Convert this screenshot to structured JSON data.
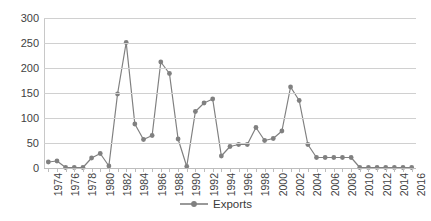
{
  "chart_data": {
    "type": "line",
    "title": "",
    "subtitle": "",
    "xlabel": "",
    "ylabel": "",
    "grid": true,
    "legend_position": "bottom",
    "ylim": [
      0,
      300
    ],
    "y_ticks": [
      0,
      50,
      100,
      150,
      200,
      250,
      300
    ],
    "x_tick_labels": [
      "1974",
      "1976",
      "1978",
      "1980",
      "1982",
      "1984",
      "1986",
      "1988",
      "1990",
      "1992",
      "1994",
      "1996",
      "1998",
      "2000",
      "2002",
      "2004",
      "2006",
      "2008",
      "2010",
      "2012",
      "2014",
      "2016"
    ],
    "x_tick_step": 2,
    "categories": [
      "1974",
      "1975",
      "1976",
      "1977",
      "1978",
      "1979",
      "1980",
      "1981",
      "1982",
      "1983",
      "1984",
      "1985",
      "1986",
      "1987",
      "1988",
      "1989",
      "1990",
      "1991",
      "1992",
      "1993",
      "1994",
      "1995",
      "1996",
      "1997",
      "1998",
      "1999",
      "2000",
      "2001",
      "2002",
      "2003",
      "2004",
      "2005",
      "2006",
      "2007",
      "2008",
      "2009",
      "2010",
      "2011",
      "2012",
      "2013",
      "2014",
      "2015",
      "2016"
    ],
    "series": [
      {
        "name": "Exports",
        "color": "#808080",
        "values": [
          12,
          14,
          1,
          1,
          1,
          20,
          29,
          4,
          148,
          251,
          88,
          57,
          65,
          212,
          189,
          58,
          3,
          113,
          130,
          138,
          24,
          43,
          47,
          47,
          81,
          55,
          59,
          74,
          162,
          135,
          47,
          21,
          21,
          21,
          21,
          21,
          1,
          1,
          1,
          1,
          1,
          1,
          1
        ]
      }
    ]
  },
  "legend": {
    "entries": [
      {
        "label": "Exports",
        "color": "#808080"
      }
    ]
  },
  "colors": {
    "series": "#808080",
    "grid": "#d0d0d0",
    "axis": "#bdbdbd",
    "text": "#3f3f3f",
    "background": "#ffffff"
  }
}
